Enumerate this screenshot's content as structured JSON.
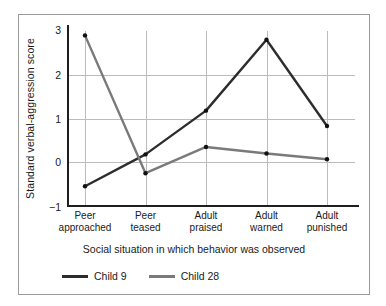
{
  "chart_data": {
    "type": "line",
    "title": "",
    "xlabel": "Social situation in which behavior was observed",
    "ylabel": "Standard verbal-aggression score",
    "categories": [
      "Peer\napproached",
      "Peer\nteased",
      "Adult\npraised",
      "Adult\nwarned",
      "Adult\npunished"
    ],
    "category_lines": [
      [
        "Peer",
        "approached"
      ],
      [
        "Peer",
        "teased"
      ],
      [
        "Adult",
        "praised"
      ],
      [
        "Adult",
        "warned"
      ],
      [
        "Adult",
        "punished"
      ]
    ],
    "ylim": [
      -1,
      3
    ],
    "yticks": [
      3,
      2,
      1,
      0,
      -1
    ],
    "ytick_labels": [
      "3",
      "2",
      "1",
      "0",
      "−1"
    ],
    "grid": "horizontal and vertical gridlines at ticks",
    "legend_position": "bottom-left",
    "markers": "filled circles at each data point",
    "series": [
      {
        "name": "Child 9",
        "color": "#2d2d2d",
        "values": [
          -0.55,
          0.18,
          1.18,
          2.8,
          0.83
        ]
      },
      {
        "name": "Child 28",
        "color": "#7a7a7a",
        "values": [
          2.9,
          -0.25,
          0.35,
          0.2,
          0.07
        ]
      }
    ]
  },
  "legend": {
    "items": [
      {
        "label": "Child 9",
        "color": "#2d2d2d"
      },
      {
        "label": "Child 28",
        "color": "#7a7a7a"
      }
    ]
  },
  "colors": {
    "frame": "#9a9a9a",
    "axis": "#1e1e1e",
    "grid": "#bcbcbc",
    "background": "#ffffff",
    "text": "#1a1a1a"
  }
}
